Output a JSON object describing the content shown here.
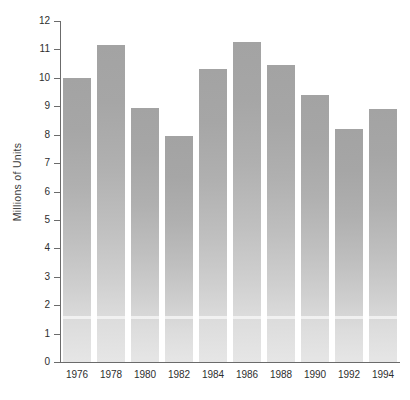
{
  "chart_data": {
    "type": "bar",
    "title": "",
    "subtitle": "",
    "xlabel": "",
    "ylabel": "Millions of Units",
    "categories": [
      "1976",
      "1978",
      "1980",
      "1982",
      "1984",
      "1986",
      "1988",
      "1990",
      "1992",
      "1994"
    ],
    "values": [
      10.0,
      11.15,
      8.95,
      7.95,
      10.3,
      11.25,
      10.45,
      9.4,
      8.2,
      8.9
    ],
    "ylim": [
      0,
      12
    ],
    "xlim_categories": 10,
    "y_ticks": [
      0,
      1,
      2,
      3,
      4,
      5,
      6,
      7,
      8,
      9,
      10,
      11,
      12
    ],
    "y_tick_labels": [
      "0",
      "1",
      "2",
      "3",
      "4",
      "5",
      "6",
      "7",
      "8",
      "9",
      "10",
      "11",
      "12"
    ],
    "grid": false,
    "legend": null,
    "legend_position": "none",
    "bar_color_top": "#a3a3a3",
    "bar_color_bottom": "#e6e6e6",
    "axis_color": "#6b6b6b",
    "text_color": "#2e2e2e",
    "background_color": "#ffffff",
    "annotations": []
  },
  "axes": {
    "y_title": "Millions of Units"
  }
}
